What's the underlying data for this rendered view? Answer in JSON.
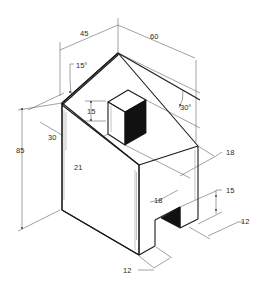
{
  "figure": {
    "dimensions": {
      "width_left": "45",
      "width_right": "60",
      "roof_angle_left": "15°",
      "roof_angle_right": "30°",
      "height_total": "85",
      "eave_offset": "30",
      "cube_offset": "21",
      "cube_height": "15",
      "step_depth_upper": "18",
      "step_depth_lower": "18",
      "notch_height": "15",
      "notch_depth": "12",
      "notch_width": "12"
    },
    "colors": {
      "line": "#1a1a1a",
      "dimension_line": "#555555",
      "shadow_fill": "#111111",
      "background": "#ffffff"
    }
  }
}
